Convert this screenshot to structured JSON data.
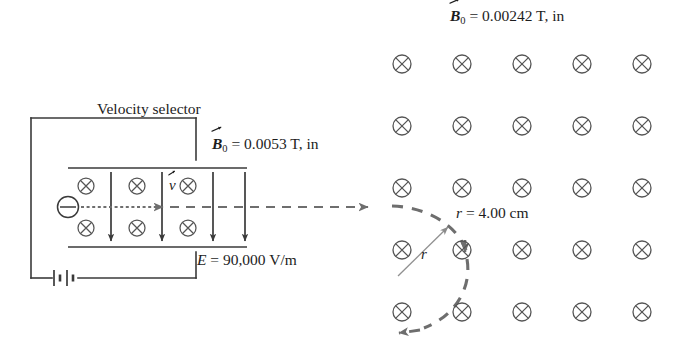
{
  "figure": {
    "stroke_color": "#3a3a3a",
    "dash_color": "#6e6e6e",
    "text_color": "#1d1d1d",
    "width": 681,
    "height": 359
  },
  "labels": {
    "field_region_B": {
      "symbol": "B",
      "subscript": "0",
      "equals": " = ",
      "value": "0.00242 T, in",
      "full_text": "B0 = 0.00242 T, in",
      "x": 450,
      "y": 8
    },
    "velocity_selector": {
      "text": "Velocity selector",
      "x": 97,
      "y": 101
    },
    "selector_B": {
      "symbol": "B",
      "subscript": "0",
      "equals": " = ",
      "value": "0.0053 T, in",
      "full_text": "B0 = 0.0053 T, in",
      "x": 212,
      "y": 136
    },
    "electric_field": {
      "symbol": "E",
      "equals": " = ",
      "value": "90,000 V/m",
      "full_text": "E = 90,000 V/m",
      "x": 197,
      "y": 252
    },
    "velocity_vector": {
      "symbol": "v",
      "full_text": "v",
      "x": 169,
      "y": 178
    },
    "radius_value": {
      "symbol": "r",
      "equals": " = ",
      "value": "4.00 cm",
      "full_text": "r = 4.00 cm",
      "x": 456,
      "y": 205
    },
    "radius_symbol": {
      "symbol": "r",
      "full_text": "r",
      "x": 421,
      "y": 247
    }
  },
  "field_grid": {
    "icon": "cross-in-circle",
    "meaning": "magnetic-field-into-page",
    "columns": 5,
    "rows": 5,
    "x_start": 402,
    "x_step": 60,
    "y_start": 64,
    "y_step": 62,
    "radius": 9
  },
  "selector": {
    "plate_top_y": 168,
    "plate_bottom_y": 247,
    "plate_x_start": 68,
    "plate_x_end": 247,
    "charge": {
      "icon": "negative-charge-circle",
      "sign": "minus",
      "x": 68,
      "y": 207,
      "r": 10
    },
    "field_cross_rows_y": [
      186,
      228
    ],
    "field_cross_x": [
      86,
      137,
      188
    ],
    "cross_radius": 8,
    "e_arrows_x": [
      111,
      162,
      213
    ],
    "e_arrow_top_y": 172,
    "e_arrow_bottom_y": 243,
    "beam_y": 207,
    "beam_x_start": 80,
    "beam_x_end": 390
  },
  "circuit": {
    "left_x": 31,
    "top_y": 118,
    "bottom_y": 278,
    "top_right_x": 196,
    "bottom_right_x": 196,
    "battery": {
      "icon": "battery-symbol",
      "x": 62,
      "y": 278,
      "plates": 4
    }
  },
  "trajectory": {
    "style": "dashed",
    "description": "circular-arc-of-charged-particle",
    "arrowheads": [
      {
        "name": "beam-exit-arrow",
        "x": 374,
        "y": 207,
        "direction": "right"
      },
      {
        "name": "arc-descending-arrow",
        "x": 465,
        "y": 253,
        "direction": "down"
      },
      {
        "name": "arc-return-arrow",
        "x": 398,
        "y": 332,
        "direction": "left"
      }
    ],
    "radius_arrow": {
      "name": "radius-indicator-arrow",
      "from_x": 400,
      "from_y": 274,
      "to_x": 447,
      "to_y": 228
    }
  }
}
